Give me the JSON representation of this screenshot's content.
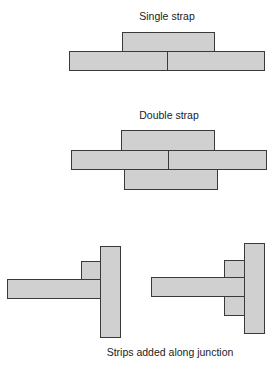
{
  "diagram": {
    "single_strap": {
      "caption": "Single strap",
      "strips": [
        {
          "name": "strap-top",
          "x": 122,
          "y": 32,
          "w": 93,
          "h": 20
        },
        {
          "name": "plank-left",
          "x": 69,
          "y": 51,
          "w": 99,
          "h": 20
        },
        {
          "name": "plank-right",
          "x": 167,
          "y": 51,
          "w": 98,
          "h": 20
        }
      ]
    },
    "double_strap": {
      "caption": "Double strap",
      "strips": [
        {
          "name": "strap-top",
          "x": 121,
          "y": 130,
          "w": 94,
          "h": 21
        },
        {
          "name": "plank-left",
          "x": 71,
          "y": 150,
          "w": 98,
          "h": 20
        },
        {
          "name": "plank-right",
          "x": 168,
          "y": 150,
          "w": 99,
          "h": 20
        },
        {
          "name": "strap-bottom",
          "x": 124,
          "y": 169,
          "w": 94,
          "h": 21
        }
      ]
    },
    "junction": {
      "caption": "Strips added along junction",
      "left_t": [
        {
          "name": "vertical-bar",
          "x": 100,
          "y": 246,
          "w": 21,
          "h": 92
        },
        {
          "name": "added-strip",
          "x": 81,
          "y": 261,
          "w": 20,
          "h": 19
        },
        {
          "name": "horizontal-bar",
          "x": 7,
          "y": 279,
          "w": 94,
          "h": 20
        }
      ],
      "right_t": [
        {
          "name": "vertical-bar",
          "x": 244,
          "y": 243,
          "w": 21,
          "h": 91
        },
        {
          "name": "added-strip-top",
          "x": 224,
          "y": 260,
          "w": 21,
          "h": 18
        },
        {
          "name": "added-strip-bottom",
          "x": 224,
          "y": 296,
          "w": 21,
          "h": 20
        },
        {
          "name": "horizontal-bar",
          "x": 151,
          "y": 277,
          "w": 94,
          "h": 20
        }
      ]
    },
    "colors": {
      "fill": "#d0d0d0",
      "stroke": "#3a3a3a",
      "text": "#222222"
    }
  }
}
